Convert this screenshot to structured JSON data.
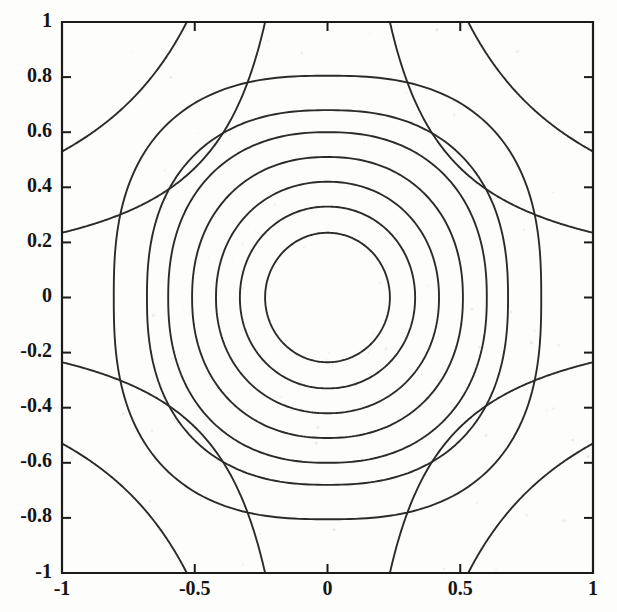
{
  "figure": {
    "title": "",
    "background_color": "#fdfdfc",
    "line_color": "#2b2b2b",
    "axis_color": "#1b1b1b"
  },
  "axes": {
    "box": {
      "left_px": 62,
      "top_px": 22,
      "right_px": 593,
      "bottom_px": 573
    },
    "xlabel": "",
    "ylabel": "",
    "xlim": [
      -1,
      1
    ],
    "ylim": [
      -1,
      1
    ],
    "x_ticks": [
      -1,
      -0.5,
      0,
      0.5,
      1
    ],
    "y_ticks": [
      1,
      0.8,
      0.6,
      0.4,
      0.2,
      0,
      -0.2,
      -0.4,
      -0.6,
      -0.8,
      -1
    ],
    "x_tick_labels": [
      "-1",
      "-0.5",
      "0",
      "0.5",
      "1"
    ],
    "y_tick_labels": [
      "1",
      "0.8",
      "0.6",
      "0.4",
      "0.2",
      "0",
      "-0.2",
      "-0.4",
      "-0.6",
      "-0.8",
      "-1"
    ],
    "grid": false,
    "legend": "none",
    "box_on": true
  },
  "chart_data": {
    "type": "line",
    "plot_kind": "contour",
    "title": "",
    "xlabel": "",
    "ylabel": "",
    "xlim": [
      -1,
      1
    ],
    "ylim": [
      -1,
      1
    ],
    "grid": false,
    "legend_position": "none",
    "x_ticks": [
      -1,
      -0.5,
      0,
      0.5,
      1
    ],
    "y_ticks": [
      1,
      0.8,
      0.6,
      0.4,
      0.2,
      0,
      -0.2,
      -0.4,
      -0.6,
      -0.8,
      -1
    ],
    "center": [
      0.0,
      0.0
    ],
    "closed_contour_radii": [
      0.235,
      0.33,
      0.42,
      0.51,
      0.6,
      0.68,
      0.805
    ],
    "closed_contour_axis_crossings_x": [
      0.235,
      0.33,
      0.42,
      0.51,
      0.6,
      0.68,
      0.805
    ],
    "closed_contour_axis_crossings_y": [
      0.235,
      0.33,
      0.42,
      0.51,
      0.6,
      0.68,
      0.805
    ],
    "corner_branch_edge_crossings": [
      0.235,
      0.53
    ],
    "corner_branch_count": 8,
    "series": [
      {
        "name": "level-1",
        "kind": "closed",
        "radius": 0.235,
        "squareness": 1.0
      },
      {
        "name": "level-2",
        "kind": "closed",
        "radius": 0.33,
        "squareness": 1.02
      },
      {
        "name": "level-3",
        "kind": "closed",
        "radius": 0.42,
        "squareness": 1.05
      },
      {
        "name": "level-4",
        "kind": "closed",
        "radius": 0.51,
        "squareness": 1.09
      },
      {
        "name": "level-5",
        "kind": "closed",
        "radius": 0.6,
        "squareness": 1.14
      },
      {
        "name": "level-6",
        "kind": "closed",
        "radius": 0.68,
        "squareness": 1.2
      },
      {
        "name": "level-7",
        "kind": "closed",
        "radius": 0.805,
        "squareness": 1.3
      },
      {
        "name": "corner-branch-outer",
        "kind": "hyperbolic",
        "edge_crossing": 0.53
      },
      {
        "name": "corner-branch-inner",
        "kind": "hyperbolic",
        "edge_crossing": 0.235
      }
    ]
  }
}
